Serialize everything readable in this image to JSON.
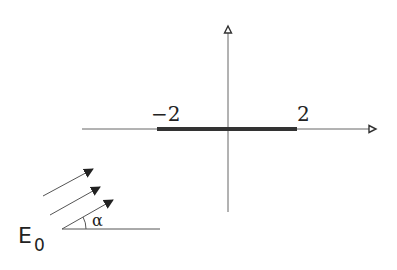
{
  "diagram": {
    "type": "complex-plane-segment-with-incident-field",
    "axes": {
      "x_axis": {
        "from": [
          82,
          129
        ],
        "to": [
          378,
          129
        ]
      },
      "y_axis": {
        "from": [
          228,
          212
        ],
        "to": [
          228,
          24
        ]
      },
      "origin": [
        228,
        129
      ]
    },
    "segment": {
      "start_label": "−2",
      "end_label": "2",
      "start_x": 157,
      "end_x": 297,
      "color": "#333333"
    },
    "incident_wave": {
      "label": "E",
      "label_subscript": "0",
      "angle_label": "α",
      "arrows": [
        {
          "from": [
            43,
            196
          ],
          "to": [
            93,
            169
          ]
        },
        {
          "from": [
            50,
            215
          ],
          "to": [
            100,
            187
          ]
        },
        {
          "from": [
            62,
            229
          ],
          "to": [
            113,
            200
          ]
        }
      ],
      "reference_line": {
        "from": [
          62,
          229
        ],
        "to": [
          160,
          229
        ]
      }
    },
    "colors": {
      "line": "#555555",
      "bold": "#333333",
      "background": "#ffffff"
    }
  }
}
